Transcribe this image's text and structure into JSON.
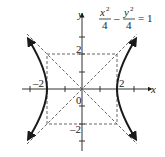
{
  "equation": {
    "num1": "x",
    "exp1": "2",
    "den1": "4",
    "minus": "–",
    "num2": "y",
    "exp2": "2",
    "den2": "4",
    "rhs": "= 1"
  },
  "axes": {
    "x_label": "x",
    "y_label": "y",
    "origin_label": "0",
    "tick_labels": {
      "x_neg": "–2",
      "x_pos": "2",
      "y_pos": "2",
      "y_neg": "–2"
    }
  },
  "colors": {
    "curve": "#1a1a1a",
    "dashed": "#555555",
    "axis": "#333333"
  }
}
